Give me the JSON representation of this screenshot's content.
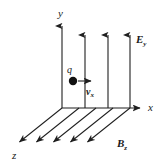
{
  "figure": {
    "background_color": "#ffffff",
    "line_color": "#1f1f1f",
    "width": 165,
    "height": 164
  },
  "axes": {
    "y": {
      "name": "y-axis",
      "label": "y",
      "label_x": 58,
      "label_y": 16,
      "x1": 62,
      "y1": 108,
      "x2": 62,
      "y2": 24
    },
    "x": {
      "name": "x-axis",
      "label": "x",
      "label_x": 148,
      "label_y": 111,
      "x1": 62,
      "y1": 108,
      "x2": 143,
      "y2": 108
    },
    "z": {
      "name": "z-axis",
      "label": "z",
      "label_x": 13,
      "label_y": 158,
      "x1": 62,
      "y1": 108,
      "x2": 17,
      "y2": 144
    }
  },
  "fields": {
    "electric": {
      "label_base": "E",
      "label_sub": "y",
      "label_x": 136,
      "label_y": 43,
      "direction": "+y",
      "arrow_x_positions": [
        62,
        85,
        108,
        130
      ],
      "arrow_top_y": [
        24,
        33,
        33,
        33
      ],
      "arrow_base_y": 108
    },
    "magnetic": {
      "label_base": "B",
      "label_sub": "z",
      "label_x": 117,
      "label_y": 148,
      "direction": "+z",
      "arrows": [
        {
          "x1": 62,
          "y1": 108,
          "x2": 17,
          "y2": 144
        },
        {
          "x1": 79,
          "y1": 108,
          "x2": 34,
          "y2": 144
        },
        {
          "x1": 96,
          "y1": 108,
          "x2": 51,
          "y2": 144
        },
        {
          "x1": 113,
          "y1": 108,
          "x2": 68,
          "y2": 144
        },
        {
          "x1": 130,
          "y1": 108,
          "x2": 85,
          "y2": 144
        }
      ]
    }
  },
  "charge": {
    "name": "point-charge",
    "label": "q",
    "label_x": 67,
    "label_y": 72,
    "dot_cx": 73,
    "dot_cy": 81,
    "dot_r": 4.2
  },
  "velocity": {
    "name": "velocity-vector",
    "label_base": "v",
    "label_sub": "x",
    "label_x": 87,
    "label_y": 96,
    "x1": 78,
    "y1": 81,
    "x2": 94,
    "y2": 81
  }
}
